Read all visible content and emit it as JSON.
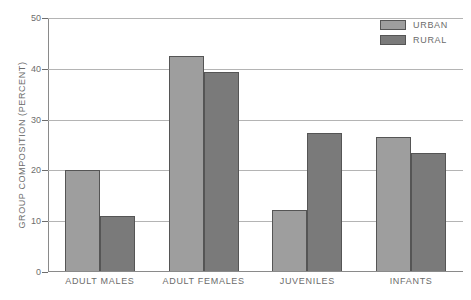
{
  "chart_data": {
    "type": "bar",
    "title": "",
    "subtitle": "",
    "xlabel": "",
    "ylabel": "GROUP COMPOSITION (PERCENT)",
    "categories": [
      "ADULT MALES",
      "ADULT FEMALES",
      "JUVENILES",
      "INFANTS"
    ],
    "series": [
      {
        "name": "URBAN",
        "color": "#9e9e9e",
        "values": [
          20.0,
          42.5,
          12.2,
          26.5
        ]
      },
      {
        "name": "RURAL",
        "color": "#7a7a7a",
        "values": [
          11.0,
          39.4,
          27.3,
          23.4
        ]
      }
    ],
    "ylim": [
      0,
      50
    ],
    "yticks": [
      0,
      10,
      20,
      30,
      40,
      50
    ],
    "ytick_labels": [
      "0",
      "10",
      "20",
      "30",
      "40",
      "50"
    ],
    "grid": true,
    "legend_position": "top-right",
    "annotations": []
  },
  "legend": {
    "items": [
      {
        "label": "URBAN",
        "swatch": "urban"
      },
      {
        "label": "RURAL",
        "swatch": "rural"
      }
    ]
  }
}
